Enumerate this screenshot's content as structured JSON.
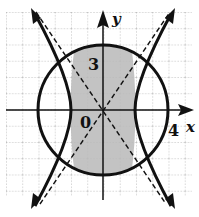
{
  "figure": {
    "type": "graph-of-inequalities",
    "labels": {
      "x_axis": "x",
      "y_axis": "y",
      "origin": "0",
      "y_mark": "3",
      "x_mark": "4"
    },
    "curves": {
      "circle": {
        "equation": "x^2 + y^2 = 16",
        "radius": 4,
        "style": "solid"
      },
      "hyperbola": {
        "equation": "x^2/4 - y^2/9 = 1",
        "a": 2,
        "b": 3,
        "style": "solid"
      },
      "asymptotes": {
        "equations": [
          "y = 1.5x",
          "y = -1.5x"
        ],
        "style": "dashed"
      }
    },
    "shaded_region": "inside circle and between hyperbola branches",
    "colors": {
      "shade": "#b8b8b8",
      "grid": "#9a9a9a",
      "ink": "#111111"
    }
  }
}
